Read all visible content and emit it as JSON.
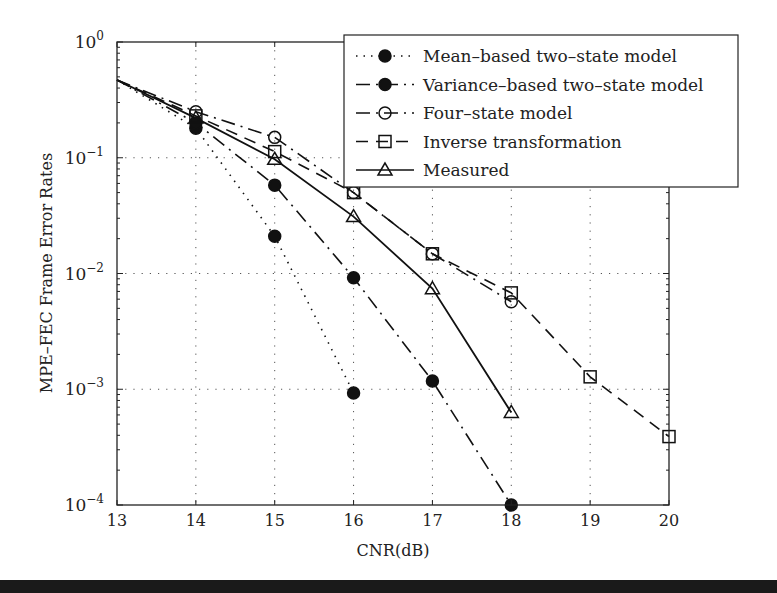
{
  "chart_data": {
    "type": "line",
    "title": "",
    "xlabel": "CNR(dB)",
    "ylabel": "MPE-FEC Frame Error Rates",
    "xlim": [
      13,
      20
    ],
    "ylim": [
      0.0001,
      1
    ],
    "yscale": "log",
    "grid": true,
    "legend_position": "upper right",
    "x_ticks": [
      "13",
      "14",
      "15",
      "16",
      "17",
      "18",
      "19",
      "20"
    ],
    "y_ticks": [
      {
        "base": "10",
        "exp": "0",
        "value": 1
      },
      {
        "base": "10",
        "exp": "−1",
        "value": 0.1
      },
      {
        "base": "10",
        "exp": "−2",
        "value": 0.01
      },
      {
        "base": "10",
        "exp": "−3",
        "value": 0.001
      },
      {
        "base": "10",
        "exp": "−4",
        "value": 0.0001
      }
    ],
    "series": [
      {
        "name": "Mean–based two–state model",
        "style": "dotted",
        "marker": "filled-circle",
        "x": [
          13,
          14,
          15,
          16
        ],
        "values": [
          0.47,
          0.18,
          0.021,
          0.00093
        ]
      },
      {
        "name": "Variance–based two–state model",
        "style": "dashdot",
        "marker": "filled-circle",
        "x": [
          13,
          14,
          15,
          16,
          17,
          18
        ],
        "values": [
          0.47,
          0.2,
          0.058,
          0.0092,
          0.00118,
          0.0001
        ]
      },
      {
        "name": "Four–state model",
        "style": "dashdot",
        "marker": "open-circle",
        "x": [
          13,
          14,
          15,
          16,
          17,
          18
        ],
        "values": [
          0.47,
          0.25,
          0.15,
          0.05,
          0.0148,
          0.0057
        ]
      },
      {
        "name": "Inverse transformation",
        "style": "dashed",
        "marker": "open-square",
        "x": [
          13,
          14,
          15,
          16,
          17,
          18,
          19,
          20
        ],
        "values": [
          0.47,
          0.23,
          0.113,
          0.05,
          0.0148,
          0.0068,
          0.00128,
          0.00039
        ]
      },
      {
        "name": "Measured",
        "style": "solid",
        "marker": "open-triangle",
        "x": [
          13,
          14,
          15,
          16,
          17,
          18
        ],
        "values": [
          0.47,
          0.22,
          0.097,
          0.031,
          0.0074,
          0.00063
        ]
      }
    ]
  },
  "legend": {
    "items": [
      "Mean–based two–state model",
      "Variance–based two–state model",
      "Four–state model",
      "Inverse transformation",
      "Measured"
    ]
  },
  "axes": {
    "xlabel": "CNR(dB)",
    "ylabel": "MPE–FEC Frame Error Rates"
  },
  "colors": {
    "ink": "#222222",
    "grid": "#555555",
    "background": "#ffffff"
  }
}
